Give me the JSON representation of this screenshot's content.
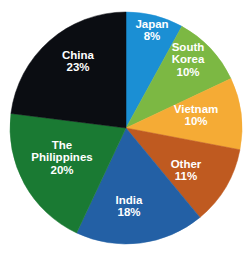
{
  "chart_data": {
    "type": "pie",
    "title": "",
    "subtitle": "",
    "xlabel": "",
    "ylabel": "",
    "legend_position": "none",
    "labels_inside_slices": true,
    "start_angle_deg": 0,
    "direction": "clockwise",
    "categories": [
      "Japan",
      "South Korea",
      "Vietnam",
      "Other",
      "India",
      "The Philippines",
      "China"
    ],
    "values": [
      8,
      10,
      10,
      11,
      18,
      20,
      23
    ],
    "value_unit": "%",
    "colors": [
      "#1b8fd4",
      "#7cb843",
      "#f5ab35",
      "#bf5a20",
      "#2360a5",
      "#1a7a33",
      "#0b0d12"
    ],
    "slices": [
      {
        "name": "Japan",
        "label_line1": "Japan",
        "label_line2": "8%",
        "value": 8,
        "color": "#1b8fd4",
        "label_color": "#ffffff",
        "label_x": 152,
        "label_y": 31
      },
      {
        "name": "South Korea",
        "label_line1": "South",
        "label_line2": "Korea",
        "label_line3": "10%",
        "value": 10,
        "color": "#7cb843",
        "label_color": "#ffffff",
        "label_x": 188,
        "label_y": 60
      },
      {
        "name": "Vietnam",
        "label_line1": "Vietnam",
        "label_line2": "10%",
        "value": 10,
        "color": "#f5ab35",
        "label_color": "#ffffff",
        "label_x": 196,
        "label_y": 116
      },
      {
        "name": "Other",
        "label_line1": "Other",
        "label_line2": "11%",
        "value": 11,
        "color": "#bf5a20",
        "label_color": "#ffffff",
        "label_x": 186,
        "label_y": 171
      },
      {
        "name": "India",
        "label_line1": "India",
        "label_line2": "18%",
        "value": 18,
        "color": "#2360a5",
        "label_color": "#ffffff",
        "label_x": 129,
        "label_y": 207
      },
      {
        "name": "The Philippines",
        "label_line1": "The",
        "label_line2": "Philippines",
        "label_line3": "20%",
        "value": 20,
        "color": "#1a7a33",
        "label_color": "#ffffff",
        "label_x": 62,
        "label_y": 158
      },
      {
        "name": "China",
        "label_line1": "China",
        "label_line2": "23%",
        "value": 23,
        "color": "#0b0d12",
        "label_color": "#ffffff",
        "label_x": 78,
        "label_y": 62
      }
    ],
    "geometry": {
      "center_x": 126,
      "center_y": 128,
      "radius": 116,
      "background": "#ffffff"
    }
  }
}
